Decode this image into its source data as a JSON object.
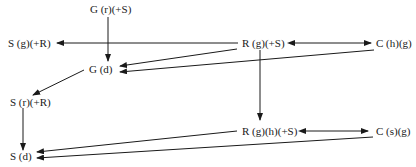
{
  "diagram": {
    "nodes": {
      "g_r_s": "G (r)(+S)",
      "s_g_r": "S (g)(+R)",
      "r_g_s": "R (g)(+S)",
      "c_h_g": "C (h)(g)",
      "g_d": "G (d)",
      "s_r_r": "S (r)(+R)",
      "r_g_h_s": "R (g)(h)(+S)",
      "c_s_g": "C (s)(g)",
      "s_d": "S (d)"
    },
    "edges": [
      {
        "from": "G (r)(+S)",
        "to": "G (d)",
        "type": "arrow"
      },
      {
        "from": "R (g)(+S)",
        "to": "S (g)(+R)",
        "type": "arrow"
      },
      {
        "from": "R (g)(+S)",
        "to": "C (h)(g)",
        "type": "bidirectional"
      },
      {
        "from": "R (g)(+S)",
        "to": "G (d)",
        "type": "arrow"
      },
      {
        "from": "C (h)(g)",
        "to": "G (d)",
        "type": "arrow"
      },
      {
        "from": "G (d)",
        "to": "S (r)(+R)",
        "type": "arrow"
      },
      {
        "from": "R (g)(+S)",
        "to": "R (g)(h)(+S)",
        "type": "arrow"
      },
      {
        "from": "R (g)(h)(+S)",
        "to": "C (s)(g)",
        "type": "bidirectional"
      },
      {
        "from": "S (r)(+R)",
        "to": "S (d)",
        "type": "arrow"
      },
      {
        "from": "R (g)(h)(+S)",
        "to": "S (d)",
        "type": "arrow"
      },
      {
        "from": "C (s)(g)",
        "to": "S (d)",
        "type": "arrow"
      }
    ]
  }
}
